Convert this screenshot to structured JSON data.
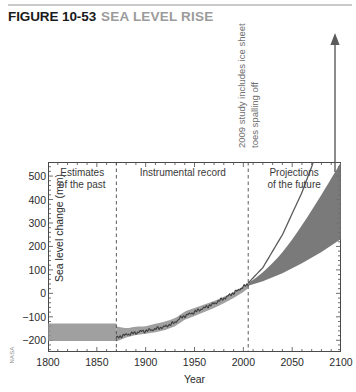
{
  "figure": {
    "number": "FIGURE 10-53",
    "title": "SEA LEVEL RISE",
    "credit": "NASA"
  },
  "annotation": {
    "spalling": "2009 study includes ice\nsheet toes spalling off"
  },
  "regions": [
    {
      "name": "estimates-of-the-past",
      "label": "Estimates\nof the past",
      "x_center_year": 1835
    },
    {
      "name": "instrumental-record",
      "label": "Instrumental record",
      "x_center_year": 1938
    },
    {
      "name": "projections-of-the-future",
      "label": "Projections\nof the future",
      "x_center_year": 2052
    }
  ],
  "dividers": [
    {
      "name": "divider-1870",
      "year": 1870
    },
    {
      "name": "divider-2005",
      "year": 2005
    }
  ],
  "colors": {
    "band_gray": "#8f8f8f",
    "line_dark": "#4a4a4a",
    "axis": "#4a4a4a",
    "title_number": "#1a1a1a",
    "title_text": "#9b9b9b",
    "annotation": "#6e6e6e"
  },
  "chart_data": {
    "type": "area",
    "title": "Sea level rise",
    "xlabel": "Year",
    "ylabel": "Sea level change (mm)",
    "xlim": [
      1800,
      2100
    ],
    "ylim": [
      -250,
      560
    ],
    "xticks": [
      1800,
      1850,
      1900,
      1950,
      2000,
      2050,
      2100
    ],
    "yticks": [
      500,
      400,
      300,
      200,
      100,
      0,
      -100,
      -200
    ],
    "x_minor_tick_step": 10,
    "y_minor_tick_step": 20,
    "grid": false,
    "legend": null,
    "series": [
      {
        "name": "Estimates of the past (uncertainty band)",
        "type": "band",
        "x": [
          1800,
          1810,
          1820,
          1830,
          1840,
          1850,
          1860,
          1870
        ],
        "upper": [
          -128,
          -128,
          -128,
          -128,
          -128,
          -128,
          -128,
          -128
        ],
        "lower": [
          -203,
          -203,
          -203,
          -203,
          -203,
          -203,
          -203,
          -203
        ]
      },
      {
        "name": "Instrumental record (uncertainty band)",
        "type": "band",
        "x": [
          1870,
          1880,
          1890,
          1900,
          1910,
          1920,
          1930,
          1940,
          1950,
          1960,
          1970,
          1980,
          1990,
          2000,
          2005
        ],
        "upper": [
          -140,
          -148,
          -142,
          -140,
          -130,
          -120,
          -105,
          -78,
          -62,
          -48,
          -33,
          -14,
          6,
          30,
          44
        ],
        "lower": [
          -205,
          -188,
          -178,
          -172,
          -166,
          -156,
          -140,
          -112,
          -96,
          -80,
          -62,
          -42,
          -20,
          6,
          22
        ]
      },
      {
        "name": "Instrumental record (observed mean)",
        "type": "line",
        "x": [
          1870,
          1875,
          1880,
          1885,
          1890,
          1895,
          1900,
          1905,
          1910,
          1915,
          1920,
          1925,
          1930,
          1935,
          1940,
          1945,
          1950,
          1955,
          1960,
          1965,
          1970,
          1975,
          1980,
          1985,
          1990,
          1995,
          2000,
          2005
        ],
        "y": [
          -190,
          -182,
          -176,
          -172,
          -168,
          -162,
          -160,
          -156,
          -152,
          -146,
          -142,
          -132,
          -124,
          -106,
          -96,
          -88,
          -80,
          -70,
          -62,
          -52,
          -44,
          -32,
          -22,
          -10,
          2,
          14,
          28,
          40
        ]
      },
      {
        "name": "Projections of the future (range)",
        "type": "band",
        "x": [
          2005,
          2020,
          2040,
          2060,
          2080,
          2100
        ],
        "upper": [
          44,
          90,
          175,
          290,
          420,
          560
        ],
        "lower": [
          32,
          52,
          86,
          128,
          176,
          232
        ]
      },
      {
        "name": "2009 study upper projection (includes ice sheet toes spalling off)",
        "type": "line",
        "x": [
          2005,
          2020,
          2040,
          2060,
          2080,
          2095
        ],
        "y": [
          44,
          110,
          250,
          430,
          650,
          820
        ],
        "note": "rises off the top of the plot, terminating in an upward arrow"
      }
    ]
  }
}
